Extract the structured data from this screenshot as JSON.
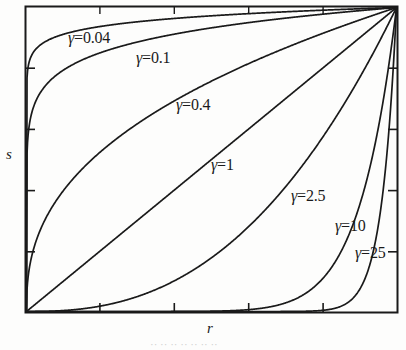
{
  "chart_data": {
    "type": "line",
    "title": "",
    "subtitle": "",
    "xlabel": "r",
    "ylabel": "s",
    "xlim": [
      0,
      1
    ],
    "ylim": [
      0,
      1
    ],
    "grid": false,
    "legend_position": "inline-labels",
    "axis_ticks": {
      "x_count": 5,
      "y_count": 5,
      "x_tick_fractions": [
        0.2,
        0.4,
        0.6,
        0.8,
        1.0
      ],
      "y_tick_fractions": [
        0.2,
        0.4,
        0.6,
        0.8,
        1.0
      ],
      "tick_direction": "inward",
      "tick_labels_shown": false
    },
    "function": "s = r^gamma",
    "series": [
      {
        "name": "γ=0.04",
        "gamma": 0.04,
        "label": "γ=0.04"
      },
      {
        "name": "γ=0.1",
        "gamma": 0.1,
        "label": "γ=0.1"
      },
      {
        "name": "γ=0.4",
        "gamma": 0.4,
        "label": "γ=0.4"
      },
      {
        "name": "γ=1",
        "gamma": 1,
        "label": "γ=1"
      },
      {
        "name": "γ=2.5",
        "gamma": 2.5,
        "label": "γ=2.5"
      },
      {
        "name": "γ=10",
        "gamma": 10,
        "label": "γ=10"
      },
      {
        "name": "γ=25",
        "gamma": 25,
        "label": "γ=25"
      }
    ],
    "annotations": [
      {
        "text": "γ=0.04",
        "gamma_symbol": "γ",
        "value": "=0.04"
      },
      {
        "text": "γ=0.1",
        "gamma_symbol": "γ",
        "value": "=0.1"
      },
      {
        "text": "γ=0.4",
        "gamma_symbol": "γ",
        "value": "=0.4"
      },
      {
        "text": "γ=1",
        "gamma_symbol": "γ",
        "value": "=1"
      },
      {
        "text": "γ=2.5",
        "gamma_symbol": "γ",
        "value": "=2.5"
      },
      {
        "text": "γ=10",
        "gamma_symbol": "γ",
        "value": "=10"
      },
      {
        "text": "γ=25",
        "gamma_symbol": "γ",
        "value": "=25"
      }
    ],
    "colors": {
      "curve": "#1a1a1a",
      "axis": "#1a1a1a",
      "background": "#fdfdfc",
      "text": "#1a1a1a"
    }
  },
  "labels": {
    "g004": {
      "sym": "γ",
      "val": "=0.04"
    },
    "g01": {
      "sym": "γ",
      "val": "=0.1"
    },
    "g04": {
      "sym": "γ",
      "val": "=0.4"
    },
    "g1": {
      "sym": "γ",
      "val": "=1"
    },
    "g25": {
      "sym": "γ",
      "val": "=2.5"
    },
    "g10": {
      "sym": "γ",
      "val": "=10"
    },
    "g250": {
      "sym": "γ",
      "val": "=25"
    }
  },
  "axes": {
    "y_title": "s",
    "x_title": "r"
  },
  "caption": {
    "sliver": "·· ·· ·· ·· ·· ·· ··"
  }
}
